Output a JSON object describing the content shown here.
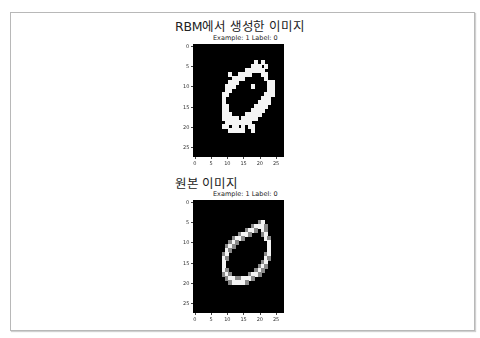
{
  "sections": [
    {
      "heading": "RBM에서 생성한 이미지",
      "plot_title": "Example: 1  Label: 0"
    },
    {
      "heading": "원본 이미지",
      "plot_title": "Example: 1  Label: 0"
    }
  ],
  "chart_data": [
    {
      "type": "heatmap",
      "title": "Example: 1  Label: 0",
      "section_heading": "RBM에서 생성한 이미지",
      "xlabel": "",
      "ylabel": "",
      "xticks": [
        0,
        5,
        10,
        15,
        20,
        25
      ],
      "yticks": [
        0,
        5,
        10,
        15,
        20,
        25
      ],
      "xlim": [
        -0.5,
        27.5
      ],
      "ylim": [
        27.5,
        -0.5
      ],
      "colormap": "gray",
      "rows": [
        "............................",
        "............................",
        "............................",
        "............................",
        "...................#.#......",
        "..................###.#.....",
        "................######......",
        "...........#..####...##.....",
        "............####......#.....",
        "...........###.........##...",
        "..........###.....#....##...",
        "..........##...........##...",
        ".........##...........###...",
        ".........#...........###....",
        ".........#..........####....",
        ".........##........####.....",
        ".........##.......####......",
        ".........###....#####.......",
        ".........#####.#####........",
        "..........########..........",
        ".........##.##.#.##.........",
        "...........#####..#.........",
        "............................",
        "............................",
        "............................",
        "............................",
        "............................",
        "............................"
      ]
    },
    {
      "type": "heatmap",
      "title": "Example: 1  Label: 0",
      "section_heading": "원본 이미지",
      "xlabel": "",
      "ylabel": "",
      "xticks": [
        0,
        5,
        10,
        15,
        20,
        25
      ],
      "yticks": [
        0,
        5,
        10,
        15,
        20,
        25
      ],
      "xlim": [
        -0.5,
        27.5
      ],
      "ylim": [
        27.5,
        -0.5
      ],
      "colormap": "gray",
      "rows": [
        "............................",
        "............................",
        "............................",
        "............................",
        "............................",
        "....................+#......",
        "..................+###+.....",
        "................+##+.#+.....",
        "..............+##+...+#.....",
        "............+##+......#+....",
        "...........+#+.........#....",
        "..........+#+..........#....",
        "..........#+...........#....",
        ".........+#...........+#....",
        ".........#+...........#+....",
        ".........#...........+#.....",
        ".........#..........+#+.....",
        ".........#+........+#+......",
        ".........+#+.....+##+.......",
        "..........+##++###+.........",
        "...........+####+...........",
        "............................",
        "............................",
        "............................",
        "............................",
        "............................",
        "............................",
        "............................"
      ]
    }
  ]
}
